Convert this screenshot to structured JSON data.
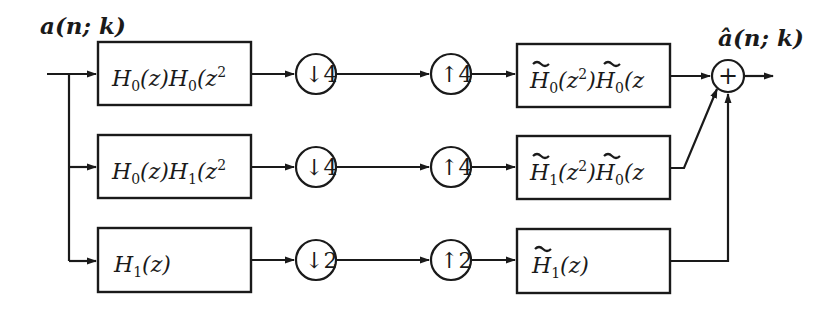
{
  "diagram": {
    "input_label": "a(n; k)",
    "output_label": "â(n; k)",
    "colors": {
      "ink": "#1a1a1a",
      "background": "#ffffff"
    },
    "branches": [
      {
        "analysis_filter": {
          "base": "H",
          "expr": "H₀(z)H₀(z²",
          "parts": [
            "H",
            "0",
            "(z)H",
            "0",
            "(z",
            "2"
          ]
        },
        "downsample": {
          "symbol": "↓",
          "factor": "4"
        },
        "upsample": {
          "symbol": "↑",
          "factor": "4"
        },
        "synthesis_filter": {
          "expr": "H̃₀(z²)H̃₀(z",
          "parts": [
            "H",
            "0",
            "(z",
            "2",
            ")H",
            "0",
            "(z"
          ]
        }
      },
      {
        "analysis_filter": {
          "base": "H",
          "expr": "H₀(z)H₁(z²",
          "parts": [
            "H",
            "0",
            "(z)H",
            "1",
            "(z",
            "2"
          ]
        },
        "downsample": {
          "symbol": "↓",
          "factor": "4"
        },
        "upsample": {
          "symbol": "↑",
          "factor": "4"
        },
        "synthesis_filter": {
          "expr": "H̃₁(z²)H̃₀(z",
          "parts": [
            "H",
            "1",
            "(z",
            "2",
            ")H",
            "0",
            "(z"
          ]
        }
      },
      {
        "analysis_filter": {
          "base": "H",
          "expr": "H₁(z)",
          "parts": [
            "H",
            "1",
            "(z)"
          ]
        },
        "downsample": {
          "symbol": "↓",
          "factor": "2"
        },
        "upsample": {
          "symbol": "↑",
          "factor": "2"
        },
        "synthesis_filter": {
          "expr": "H̃₁(z)",
          "parts": [
            "H",
            "1",
            "(z)"
          ]
        }
      }
    ],
    "summer": {
      "symbol": "+"
    }
  }
}
